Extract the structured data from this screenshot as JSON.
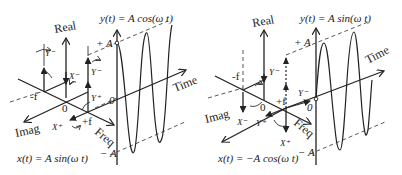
{
  "left_panel": {
    "output_equation": "y(t) = A cos(ω t)",
    "input_equation": "x(t) = A sin(ω t)",
    "axes": {
      "real": "Real",
      "imag": "Imag",
      "freq": "Freq",
      "time": "Time"
    },
    "freq_ticks": {
      "neg": "-f",
      "pos": "+f",
      "origin": "0"
    },
    "amplitude_ticks": {
      "pos": "+ A",
      "zero": "0",
      "neg": "− A"
    },
    "phasor_labels": {
      "x_minus": "X⁻",
      "x_plus": "X⁺",
      "y_minus_left": "Y⁻",
      "y_minus_right": "Y⁻",
      "y_plus": "Y⁺"
    }
  },
  "right_panel": {
    "output_equation": "y(t) = A sin(ω t)",
    "input_equation": "x(t) = −A cos(ω t)",
    "axes": {
      "real": "Real",
      "imag": "Imag",
      "freq": "Freq",
      "time": "Time"
    },
    "freq_ticks": {
      "neg": "-f",
      "pos": "+f",
      "origin": "0"
    },
    "amplitude_ticks": {
      "pos": "+ A",
      "zero": "0",
      "neg": "− A"
    },
    "phasor_labels": {
      "x_minus": "X⁻",
      "x_plus": "X⁺",
      "y_minus_top": "Y⁻",
      "y_minus_time": "Y⁻",
      "y_plus": "Y⁺"
    }
  },
  "colors": {
    "ink": "#222222",
    "background": "#ffffff"
  }
}
